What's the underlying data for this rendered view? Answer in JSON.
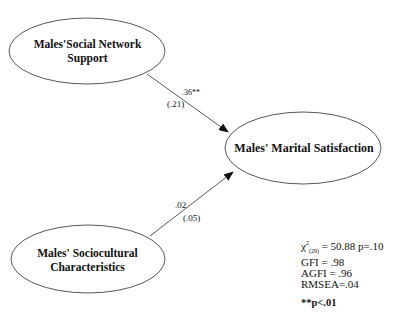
{
  "diagram": {
    "nodes": [
      {
        "id": "social_support",
        "label_line1": "Males'Social Network",
        "label_line2": "Support"
      },
      {
        "id": "marital_satisfaction",
        "label_line1": "Males' Marital Satisfaction"
      },
      {
        "id": "sociocultural",
        "label_line1": "Males' Sociocultural",
        "label_line2": "Characteristics"
      }
    ],
    "paths": [
      {
        "from": "social_support",
        "to": "marital_satisfaction",
        "coef": ".36**",
        "se": "(.21)"
      },
      {
        "from": "sociocultural",
        "to": "marital_satisfaction",
        "coef": ".02",
        "se": "(.05)"
      }
    ],
    "fit": {
      "chi_symbol": "χ",
      "chi_sup": "2",
      "chi_sub": "(29)",
      "chi_value": " = 50.88 p=.10",
      "gfi": "GFI = .98",
      "agfi": "AGFI = .96",
      "rmsea": "RMSEA=.04"
    },
    "note": "**p<.01"
  }
}
